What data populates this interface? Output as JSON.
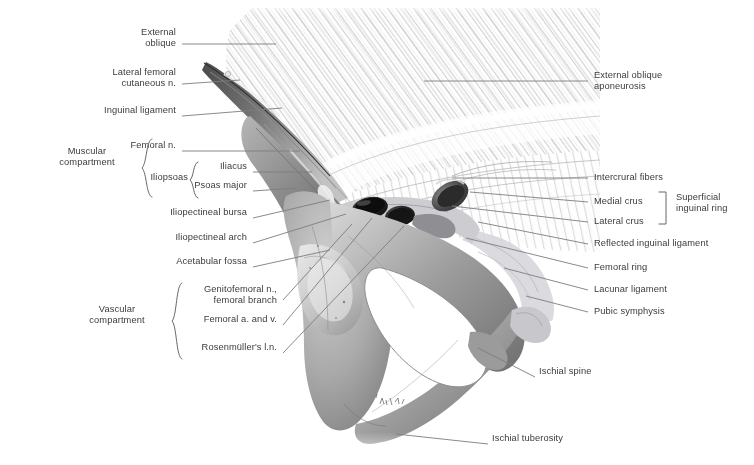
{
  "figure": {
    "type": "anatomical-illustration",
    "style": "grayscale pencil rendering",
    "background_color": "#ffffff",
    "label_color": "#3b3b3f",
    "leader_color": "#7d7d82"
  },
  "labels_left": [
    {
      "id": "external-oblique",
      "text": "External\noblique",
      "x": 176,
      "y": 33,
      "lines": 2
    },
    {
      "id": "lateral-femoral-cut-n",
      "text": "Lateral femoral\ncutaneous n.",
      "x": 176,
      "y": 73,
      "lines": 2
    },
    {
      "id": "inguinal-ligament",
      "text": "Inguinal ligament",
      "x": 176,
      "y": 111,
      "lines": 1
    },
    {
      "id": "femoral-n",
      "text": "Femoral n.",
      "x": 176,
      "y": 146,
      "lines": 1
    },
    {
      "id": "iliacus",
      "text": "Iliacus",
      "x": 247,
      "y": 167,
      "lines": 1
    },
    {
      "id": "psoas-major",
      "text": "Psoas major",
      "x": 247,
      "y": 186,
      "lines": 1
    },
    {
      "id": "iliopectineal-bursa",
      "text": "Iliopectineal bursa",
      "x": 247,
      "y": 213,
      "lines": 1
    },
    {
      "id": "iliopectineal-arch",
      "text": "Iliopectineal arch",
      "x": 247,
      "y": 238,
      "lines": 1
    },
    {
      "id": "acetabular-fossa",
      "text": "Acetabular fossa",
      "x": 247,
      "y": 262,
      "lines": 1
    },
    {
      "id": "genitofemoral-n",
      "text": "Genitofemoral n.,\nfemoral branch",
      "x": 277,
      "y": 290,
      "lines": 2
    },
    {
      "id": "femoral-a-and-v",
      "text": "Femoral a. and v.",
      "x": 277,
      "y": 320,
      "lines": 1
    },
    {
      "id": "rosenmullers-ln",
      "text": "Rosenmüller's l.n.",
      "x": 277,
      "y": 348,
      "lines": 1
    }
  ],
  "labels_right": [
    {
      "id": "external-oblique-aponeurosis",
      "text": "External oblique\naponeurosis",
      "x": 594,
      "y": 76,
      "lines": 2
    },
    {
      "id": "intercrural-fibers",
      "text": "Intercrural fibers",
      "x": 594,
      "y": 173,
      "lines": 1
    },
    {
      "id": "medial-crus",
      "text": "Medial crus",
      "x": 594,
      "y": 197,
      "lines": 1
    },
    {
      "id": "lateral-crus",
      "text": "Lateral crus",
      "x": 594,
      "y": 217,
      "lines": 1
    },
    {
      "id": "reflected-inguinal-ligament",
      "text": "Reflected inguinal ligament",
      "x": 594,
      "y": 239,
      "lines": 1
    },
    {
      "id": "femoral-ring",
      "text": "Femoral ring",
      "x": 594,
      "y": 263,
      "lines": 1
    },
    {
      "id": "lacunar-ligament",
      "text": "Lacunar ligament",
      "x": 594,
      "y": 285,
      "lines": 1
    },
    {
      "id": "pubic-symphysis",
      "text": "Pubic symphysis",
      "x": 594,
      "y": 307,
      "lines": 1
    }
  ],
  "labels_bottom": [
    {
      "id": "ischial-spine",
      "text": "Ischial spine",
      "x": 539,
      "y": 372,
      "lines": 1
    },
    {
      "id": "ischial-tuberosity",
      "text": "Ischial tuberosity",
      "x": 492,
      "y": 439,
      "lines": 1
    }
  ],
  "group_labels": [
    {
      "id": "muscular-compartment",
      "text": "Muscular\ncompartment",
      "x": 46,
      "y": 152,
      "align": "center",
      "width": 96
    },
    {
      "id": "iliopsoas",
      "text": "Iliopsoas",
      "x": 120,
      "y": 177,
      "align": "right",
      "width": 68
    },
    {
      "id": "vascular-compartment",
      "text": "Vascular\ncompartment",
      "x": 80,
      "y": 310,
      "align": "center",
      "width": 92
    },
    {
      "id": "superficial-inguinal-ring",
      "text": "Superficial\ninguinal ring",
      "x": 676,
      "y": 198,
      "align": "left",
      "width": 76
    }
  ],
  "brackets": [
    {
      "id": "bracket-muscular-compartment",
      "kind": "curly-left",
      "x": 146,
      "y": 139,
      "height": 60
    },
    {
      "id": "bracket-iliopsoas",
      "kind": "curly-left",
      "x": 193,
      "y": 162,
      "height": 36
    },
    {
      "id": "bracket-vascular-compartment",
      "kind": "curly-left",
      "x": 176,
      "y": 283,
      "height": 76
    },
    {
      "id": "bracket-superficial-ring",
      "kind": "square-right",
      "x": 655,
      "y": 192,
      "height": 32
    }
  ],
  "artwork_regions": [
    {
      "id": "external-oblique-aponeurosis-sheet",
      "desc": "large fan of diagonal fibrous striations, upper right"
    },
    {
      "id": "inguinal-ligament-edge",
      "desc": "sharp tapering edge running from upper-left apex down-right"
    },
    {
      "id": "iliopsoas-muscle",
      "desc": "shaded muscle belly beneath the inguinal ligament"
    },
    {
      "id": "femoral-vessels",
      "desc": "two dark ovals (femoral artery and vein) in the vascular lacuna"
    },
    {
      "id": "superficial-inguinal-ring-opening",
      "desc": "dark oval opening to the right of the vessels"
    },
    {
      "id": "hip-bone",
      "desc": "pelvic bone with acetabulum, obturator foramen, ischial spine and tuberosity"
    },
    {
      "id": "obturator-foramen",
      "desc": "large white aperture in the centre of the hip bone"
    },
    {
      "id": "acetabular-fossa-cup",
      "desc": "pale cup-shaped depression left of the obturator foramen"
    },
    {
      "id": "artist-signature",
      "desc": "small handwritten signature on the ischial ramus"
    }
  ]
}
